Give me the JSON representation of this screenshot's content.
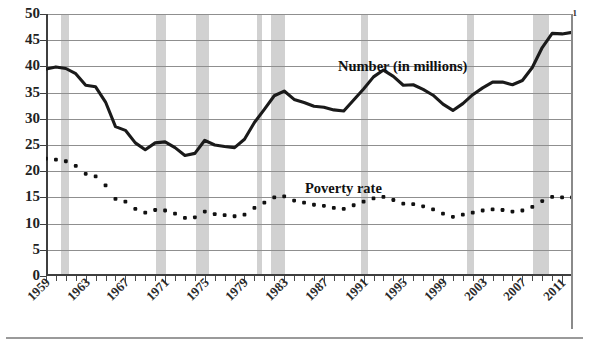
{
  "chart_data": {
    "type": "line",
    "title": "",
    "xlabel": "",
    "ylabel": "",
    "xlim": [
      1959,
      2012
    ],
    "ylim": [
      0,
      50
    ],
    "ytick_step": 5,
    "grid": true,
    "legend_position": "inline-annotation",
    "yticks": [
      0,
      5,
      10,
      15,
      20,
      25,
      30,
      35,
      40,
      45,
      50
    ],
    "xtick_labels": [
      "1959",
      "1963",
      "1967",
      "1971",
      "1975",
      "1979",
      "1983",
      "1987",
      "1991",
      "1995",
      "1999",
      "2003",
      "2007",
      "2011"
    ],
    "xtick_years": [
      1959,
      1963,
      1967,
      1971,
      1975,
      1979,
      1983,
      1987,
      1991,
      1995,
      1999,
      2003,
      2007,
      2011
    ],
    "annotations": [
      {
        "name": "number-series-label",
        "text": "Number (in millions)"
      },
      {
        "name": "poverty-rate-series-label",
        "text": "Poverty rate"
      },
      {
        "name": "footnote-marker",
        "text": "1"
      }
    ],
    "recession_bands": [
      {
        "start": 1960.3,
        "end": 1961.1
      },
      {
        "start": 1969.9,
        "end": 1970.9
      },
      {
        "start": 1973.9,
        "end": 1975.2
      },
      {
        "start": 1980.1,
        "end": 1980.6
      },
      {
        "start": 1981.5,
        "end": 1982.9
      },
      {
        "start": 1990.5,
        "end": 1991.2
      },
      {
        "start": 2001.2,
        "end": 2001.9
      },
      {
        "start": 2007.9,
        "end": 2009.5
      }
    ],
    "band_color": "#c9c9c9",
    "series": [
      {
        "name": "Number (in millions)",
        "style": "solid",
        "color": "#1a1a1a",
        "x": [
          1959,
          1960,
          1961,
          1962,
          1963,
          1964,
          1965,
          1966,
          1967,
          1968,
          1969,
          1970,
          1971,
          1972,
          1973,
          1974,
          1975,
          1976,
          1977,
          1978,
          1979,
          1980,
          1981,
          1982,
          1983,
          1984,
          1985,
          1986,
          1987,
          1988,
          1989,
          1990,
          1991,
          1992,
          1993,
          1994,
          1995,
          1996,
          1997,
          1998,
          1999,
          2000,
          2001,
          2002,
          2003,
          2004,
          2005,
          2006,
          2007,
          2008,
          2009,
          2010,
          2011,
          2012
        ],
        "values": [
          39.5,
          39.9,
          39.6,
          38.6,
          36.4,
          36.1,
          33.2,
          28.5,
          27.8,
          25.4,
          24.1,
          25.4,
          25.6,
          24.5,
          23.0,
          23.4,
          25.9,
          25.0,
          24.7,
          24.5,
          26.1,
          29.3,
          31.8,
          34.4,
          35.3,
          33.7,
          33.1,
          32.4,
          32.2,
          31.7,
          31.5,
          33.6,
          35.7,
          38.0,
          39.3,
          38.1,
          36.4,
          36.5,
          35.6,
          34.5,
          32.8,
          31.6,
          32.9,
          34.6,
          35.9,
          37.0,
          37.0,
          36.5,
          37.3,
          39.8,
          43.6,
          46.3,
          46.2,
          46.5
        ]
      },
      {
        "name": "Poverty rate",
        "style": "dotted",
        "color": "#111111",
        "x": [
          1959,
          1960,
          1961,
          1962,
          1963,
          1964,
          1965,
          1966,
          1967,
          1968,
          1969,
          1970,
          1971,
          1972,
          1973,
          1974,
          1975,
          1976,
          1977,
          1978,
          1979,
          1980,
          1981,
          1982,
          1983,
          1984,
          1985,
          1986,
          1987,
          1988,
          1989,
          1990,
          1991,
          1992,
          1993,
          1994,
          1995,
          1996,
          1997,
          1998,
          1999,
          2000,
          2001,
          2002,
          2003,
          2004,
          2005,
          2006,
          2007,
          2008,
          2009,
          2010,
          2011,
          2012
        ],
        "values": [
          22.4,
          22.2,
          21.9,
          21.0,
          19.5,
          19.0,
          17.3,
          14.7,
          14.2,
          12.8,
          12.1,
          12.6,
          12.5,
          11.9,
          11.1,
          11.2,
          12.3,
          11.8,
          11.6,
          11.4,
          11.7,
          13.0,
          14.0,
          15.0,
          15.2,
          14.4,
          14.0,
          13.6,
          13.4,
          13.0,
          12.8,
          13.5,
          14.2,
          14.8,
          15.1,
          14.5,
          13.8,
          13.7,
          13.3,
          12.7,
          11.9,
          11.3,
          11.7,
          12.1,
          12.5,
          12.7,
          12.6,
          12.3,
          12.5,
          13.2,
          14.3,
          15.1,
          15.0,
          15.0
        ]
      }
    ]
  }
}
